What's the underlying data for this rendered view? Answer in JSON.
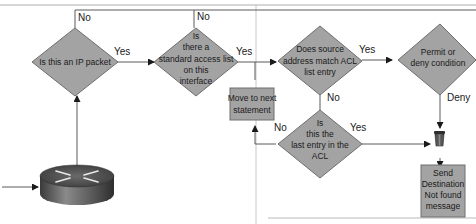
{
  "diagram": {
    "colors": {
      "shape_fill": "#a3a3a3",
      "shape_stroke": "#6e6e6e",
      "line": "#5a5a5a",
      "frame": "#b5b5b5",
      "background": "#ffffff"
    },
    "nodes": {
      "is_ip_packet": {
        "type": "decision",
        "lines": [
          "Is this an IP packet"
        ]
      },
      "standard_acl": {
        "type": "decision",
        "lines": [
          "Is",
          "there a",
          "standard access list",
          "on this",
          "interface"
        ]
      },
      "source_match": {
        "type": "decision",
        "lines": [
          "Does source",
          "address match ACL",
          "list entry"
        ]
      },
      "permit_deny": {
        "type": "decision",
        "lines": [
          "Permit or",
          "deny condition"
        ]
      },
      "move_next": {
        "type": "process",
        "lines": [
          "Move to next",
          "statement"
        ]
      },
      "last_entry": {
        "type": "decision",
        "lines": [
          "Is",
          "this the",
          "last entry in the",
          "ACL"
        ]
      },
      "send_dest": {
        "type": "process",
        "lines": [
          "Send",
          "Destination",
          "Not found",
          "message"
        ]
      },
      "router": {
        "type": "router-icon"
      },
      "bit_bucket": {
        "type": "trash-icon"
      }
    },
    "edge_labels": {
      "ip_no": "No",
      "ip_yes": "Yes",
      "acl_no": "No",
      "acl_yes": "Yes",
      "match_yes": "Yes",
      "match_no": "No",
      "permit_deny_deny": "Deny",
      "last_no": "No",
      "last_yes": "Yes"
    }
  }
}
